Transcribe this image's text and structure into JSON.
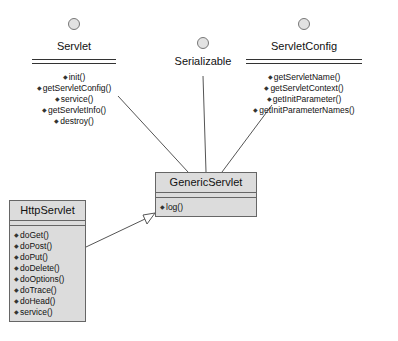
{
  "diagram": {
    "type": "uml-class-diagram",
    "interfaces": [
      {
        "name": "Servlet",
        "methods": [
          "init()",
          "getServletConfig()",
          "service()",
          "getServletInfo()",
          "destroy()"
        ]
      },
      {
        "name": "Serializable",
        "methods": []
      },
      {
        "name": "ServletConfig",
        "methods": [
          "getServletName()",
          "getServletContext()",
          "getInitParameter()",
          "getInitParameterNames()"
        ]
      }
    ],
    "classes": [
      {
        "name": "GenericServlet",
        "methods": [
          "log()"
        ]
      },
      {
        "name": "HttpServlet",
        "methods": [
          "doGet()",
          "doPost()",
          "doPut()",
          "doDelete()",
          "doOptions()",
          "doTrace()",
          "doHead()",
          "service()"
        ]
      }
    ],
    "relations": [
      {
        "from": "GenericServlet",
        "to": "Servlet",
        "kind": "realization"
      },
      {
        "from": "GenericServlet",
        "to": "Serializable",
        "kind": "realization"
      },
      {
        "from": "GenericServlet",
        "to": "ServletConfig",
        "kind": "realization"
      },
      {
        "from": "HttpServlet",
        "to": "GenericServlet",
        "kind": "generalization"
      }
    ]
  }
}
